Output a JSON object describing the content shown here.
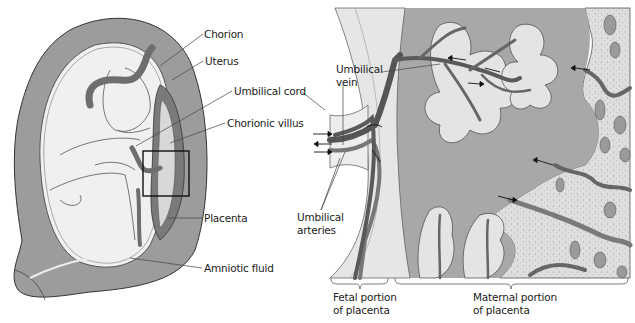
{
  "figure": {
    "type": "anatomical-diagram"
  },
  "left_panel": {
    "name": "uterus-with-fetus",
    "labels": {
      "chorion": "Chorion",
      "uterus": "Uterus",
      "umbilical_cord": "Umbilical cord",
      "chorionic_villus": "Chorionic villus",
      "placenta": "Placenta",
      "amniotic_fluid": "Amniotic fluid"
    },
    "inset_box": "detail region enlarged on right"
  },
  "right_panel": {
    "name": "placenta-detail",
    "labels": {
      "umbilical_vein_line1": "Umbilical",
      "umbilical_vein_line2": "vein",
      "umbilical_arteries_line1": "Umbilical",
      "umbilical_arteries_line2": "arteries"
    },
    "brackets": {
      "fetal_line1": "Fetal portion",
      "fetal_line2": "of placenta",
      "maternal_line1": "Maternal portion",
      "maternal_line2": "of placenta"
    }
  },
  "colors": {
    "uterus_wall": "#9a9a9a",
    "inner_cavity": "#efefef",
    "vessel": "#6e6e6e",
    "vessel_dark": "#4a4a4a",
    "maternal_blood": "#a9a9a9",
    "maternal_tissue": "#dcdcdc",
    "outline": "#333333"
  }
}
